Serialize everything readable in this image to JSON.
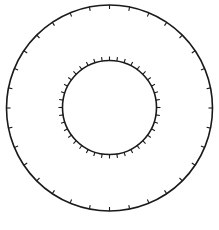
{
  "diagram": {
    "background": "#ffffff",
    "stroke_color": "#1a1a1a",
    "outer_ring": {
      "cx": 109.5,
      "cy": 108,
      "r": 103,
      "stroke_width": 1.6,
      "tick_count": 32,
      "tick_length": 4,
      "tick_direction": "inward"
    },
    "inner_ring": {
      "cx": 109.5,
      "cy": 107.5,
      "r": 47,
      "stroke_width": 1.6,
      "tick_count": 40,
      "tick_length": 4,
      "tick_direction": "outward"
    }
  }
}
